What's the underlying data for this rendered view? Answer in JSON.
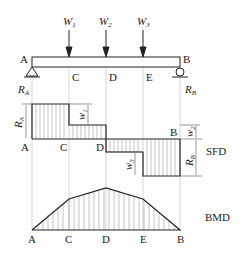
{
  "diagram": {
    "type": "beam shear force and bending moment diagram",
    "points": [
      "A",
      "C",
      "D",
      "E",
      "B"
    ],
    "loads": [
      {
        "label": "W",
        "sub": "1",
        "at": "C"
      },
      {
        "label": "W",
        "sub": "2",
        "at": "D"
      },
      {
        "label": "W",
        "sub": "3",
        "at": "E"
      }
    ],
    "reactions": {
      "left": {
        "label": "R",
        "sub": "A"
      },
      "right": {
        "label": "R",
        "sub": "B"
      }
    },
    "sfd": {
      "title": "SFD",
      "dims": {
        "ra": {
          "label": "R",
          "sub": "A"
        },
        "w1": {
          "label": "w",
          "sub": "1"
        },
        "w2": {
          "label": "w",
          "sub": "2"
        },
        "w3": {
          "label": "w",
          "sub": "3"
        },
        "rb": {
          "label": "R",
          "sub": "B"
        }
      }
    },
    "bmd": {
      "title": "BMD"
    },
    "colors": {
      "line": "#222222",
      "guide": "#bbbbbb",
      "hatch": "#999999"
    }
  }
}
